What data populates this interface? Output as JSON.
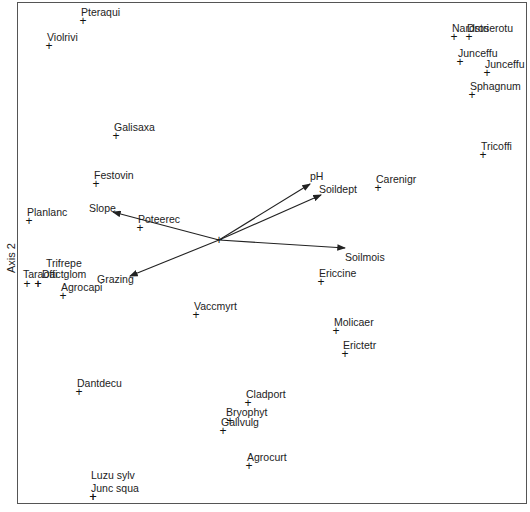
{
  "chart_data": {
    "type": "scatter",
    "title": "",
    "xlabel": "",
    "ylabel": "Axis 2",
    "grid": false,
    "legend": null,
    "origin_px": [
      219,
      240
    ],
    "species": [
      {
        "name": "Pteraqui",
        "px": [
          83,
          21
        ]
      },
      {
        "name": "Violrivi",
        "px": [
          49,
          46
        ]
      },
      {
        "name": "Galisaxa",
        "px": [
          116,
          136
        ]
      },
      {
        "name": "Festovin",
        "px": [
          96,
          184
        ]
      },
      {
        "name": "Planlanc",
        "px": [
          29,
          221
        ]
      },
      {
        "name": "Poteerec",
        "px": [
          140,
          228
        ]
      },
      {
        "name": "Trifrepe",
        "px": [
          38,
          284
        ]
      },
      {
        "name": "Taraoffi",
        "px": [
          27,
          284
        ]
      },
      {
        "name": "Dactglom",
        "px": [
          38,
          284
        ]
      },
      {
        "name": "Agrocapi",
        "px": [
          63,
          296
        ]
      },
      {
        "name": "Vaccmyrt",
        "px": [
          196,
          315
        ]
      },
      {
        "name": "Nardstri",
        "px": [
          454,
          37
        ]
      },
      {
        "name": "Droserotu",
        "px": [
          469,
          37
        ]
      },
      {
        "name": "Junceffu",
        "px": [
          460,
          62
        ]
      },
      {
        "name": "Junceffu",
        "px": [
          487,
          73
        ]
      },
      {
        "name": "Sphagnum",
        "px": [
          472,
          95
        ]
      },
      {
        "name": "Tricoffi",
        "px": [
          483,
          155
        ]
      },
      {
        "name": "Carenigr",
        "px": [
          378,
          188
        ]
      },
      {
        "name": "Ericcine",
        "px": [
          321,
          282
        ]
      },
      {
        "name": "Molicaer",
        "px": [
          336,
          331
        ]
      },
      {
        "name": "Erictetr",
        "px": [
          345,
          354
        ]
      },
      {
        "name": "Dantdecu",
        "px": [
          79,
          392
        ]
      },
      {
        "name": "Cladport",
        "px": [
          248,
          403
        ]
      },
      {
        "name": "Bryophyt",
        "px": [
          230,
          421
        ]
      },
      {
        "name": "Gallvulg",
        "px": [
          223,
          431
        ]
      },
      {
        "name": "Agrocurt",
        "px": [
          249,
          466
        ]
      },
      {
        "name": "Luzu sylv",
        "px": [
          93,
          497
        ]
      },
      {
        "name": "Junc squa",
        "px": [
          93,
          497
        ]
      }
    ],
    "vectors": [
      {
        "name": "pH",
        "tip_px": [
          310,
          184
        ]
      },
      {
        "name": "Soildept",
        "tip_px": [
          321,
          195
        ]
      },
      {
        "name": "Soilmois",
        "tip_px": [
          345,
          248
        ]
      },
      {
        "name": "Slope",
        "tip_px": [
          113,
          212
        ]
      },
      {
        "name": "Grazing",
        "tip_px": [
          130,
          276
        ]
      }
    ]
  },
  "axis": {
    "ylabel": "Axis 2"
  }
}
